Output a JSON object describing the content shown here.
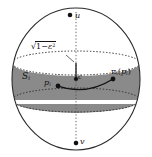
{
  "figure": {
    "type": "geometric-diagram",
    "colors": {
      "outline": "#2b2b2b",
      "band_fill": "#8a8a8a",
      "dotted": "#3a3a3a",
      "point": "#111111",
      "background": "#ffffff"
    },
    "sphere": {
      "center": {
        "x": 76,
        "y": 79
      },
      "radius_x": 64,
      "radius_y": 71
    },
    "band": {
      "top_y": 63,
      "bottom_y": 100
    }
  },
  "labels": {
    "pole_top": "u",
    "pole_bottom": "v",
    "center_point": "c",
    "slab": {
      "base": "S",
      "sub": "i"
    },
    "source_point": {
      "base": "p",
      "sub": "i"
    },
    "projected_point": {
      "pi": "π",
      "pi_sub": "i",
      "open": "(",
      "base": "p",
      "sub": "i",
      "close": ")"
    },
    "height": {
      "radical": "√",
      "one": "1",
      "minus": "−",
      "eps": "ε",
      "exp": "2"
    }
  },
  "points": {
    "u": {
      "x": 70,
      "y": 15
    },
    "v": {
      "x": 76,
      "y": 143
    },
    "c": {
      "x": 76,
      "y": 79
    },
    "pi": {
      "x": 58,
      "y": 86
    },
    "proj": {
      "x": 113,
      "y": 79
    }
  }
}
